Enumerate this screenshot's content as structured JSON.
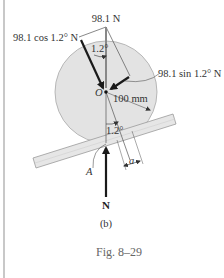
{
  "figure": {
    "caption": "Fig. 8–29",
    "subfigure_label": "(b)",
    "labels": {
      "weight": "98.1 N",
      "cos_component": "98.1 cos 1.2° N",
      "sin_component": "98.1 sin 1.2° N",
      "center": "O",
      "radius": "100 mm",
      "angle_top": "1.2°",
      "angle_bottom": "1.2°",
      "point_a": "A",
      "offset": "a",
      "normal_force": "N"
    },
    "colors": {
      "disk_fill": "#e3e3e3",
      "disk_stroke": "#a8a8a8",
      "plank_fill": "#e6e6e6",
      "plank_stroke": "#9a9a9a",
      "arrow": "#1a1a1a",
      "thin_line": "#555555",
      "left_rule": "#c8c8c8"
    }
  }
}
